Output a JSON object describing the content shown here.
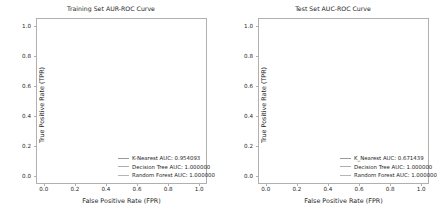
{
  "figure": {
    "width": 444,
    "height": 218,
    "background": "#ffffff"
  },
  "chart_data": [
    {
      "type": "line",
      "panel": "left",
      "title": "Training Set AUR-ROC Curve",
      "xlabel": "False Positive Rate (FPR)",
      "ylabel": "True Positive Rate (TPR)",
      "xlim": [
        -0.05,
        1.05
      ],
      "ylim": [
        -0.05,
        1.05
      ],
      "xticks": [
        "0.0",
        "0.2",
        "0.4",
        "0.6",
        "0.8",
        "1.0"
      ],
      "xtick_values": [
        0.0,
        0.2,
        0.4,
        0.6,
        0.8,
        1.0
      ],
      "yticks": [
        "0.0",
        "0.2",
        "0.4",
        "0.6",
        "0.8",
        "1.0"
      ],
      "ytick_values": [
        0.0,
        0.2,
        0.4,
        0.6,
        0.8,
        1.0
      ],
      "grid": false,
      "legend_position": "lower right",
      "series": [
        {
          "name": "K-Nearest",
          "legend": "K-Nearest AUC: 0.954093",
          "auc": 0.954093,
          "color": "#9a9a9a",
          "points": [
            [
              0.0,
              0.0
            ],
            [
              0.004,
              0.43
            ],
            [
              0.13,
              1.0
            ],
            [
              1.0,
              1.0
            ]
          ]
        },
        {
          "name": "Decision Tree",
          "legend": "Decision Tree AUC: 1.000000",
          "auc": 1.0,
          "color": "#aeaeae",
          "points": [
            [
              0.0,
              0.0
            ],
            [
              0.0,
              1.0
            ],
            [
              1.0,
              1.0
            ]
          ]
        },
        {
          "name": "Random Forest",
          "legend": "Random Forest AUC: 1.000000",
          "auc": 1.0,
          "color": "#b5b5b5",
          "points": [
            [
              0.0,
              0.0
            ],
            [
              0.0,
              1.0
            ],
            [
              1.0,
              1.0
            ]
          ]
        }
      ]
    },
    {
      "type": "line",
      "panel": "right",
      "title": "Test Set AUC-ROC Curve",
      "xlabel": "False Positive Rate (FPR)",
      "ylabel": "True Positive Rate (TPR)",
      "xlim": [
        -0.05,
        1.05
      ],
      "ylim": [
        -0.05,
        1.05
      ],
      "xticks": [
        "0.0",
        "0.2",
        "0.4",
        "0.6",
        "0.8",
        "1.0"
      ],
      "xtick_values": [
        0.0,
        0.2,
        0.4,
        0.6,
        0.8,
        1.0
      ],
      "yticks": [
        "0.0",
        "0.2",
        "0.4",
        "0.6",
        "0.8",
        "1.0"
      ],
      "ytick_values": [
        0.0,
        0.2,
        0.4,
        0.6,
        0.8,
        1.0
      ],
      "grid": false,
      "legend_position": "lower right",
      "series": [
        {
          "name": "K_Nearest",
          "legend": "K_Nearest AUC: 0.671439",
          "auc": 0.671439,
          "color": "#9a9a9a",
          "points": [
            [
              0.0,
              0.0
            ],
            [
              0.012,
              0.2
            ],
            [
              0.155,
              0.525
            ],
            [
              1.0,
              1.0
            ]
          ]
        },
        {
          "name": "Decision Tree",
          "legend": "Decision Tree AUC: 1.000000",
          "auc": 1.0,
          "color": "#aeaeae",
          "points": [
            [
              0.0,
              0.0
            ],
            [
              0.0,
              1.0
            ],
            [
              1.0,
              1.0
            ]
          ]
        },
        {
          "name": "Random Forest",
          "legend": "Random Forest AUC: 1.000000",
          "auc": 1.0,
          "color": "#b5b5b5",
          "points": [
            [
              0.0,
              0.0
            ],
            [
              0.0,
              1.0
            ],
            [
              1.0,
              1.0
            ]
          ]
        }
      ]
    }
  ]
}
